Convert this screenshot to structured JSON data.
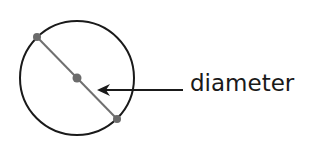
{
  "diagram": {
    "label": "diameter",
    "colors": {
      "circle": "#1a1a1a",
      "diameter_line": "#707070",
      "points": "#6b6b6b",
      "arrow": "#1a1a1a"
    }
  }
}
